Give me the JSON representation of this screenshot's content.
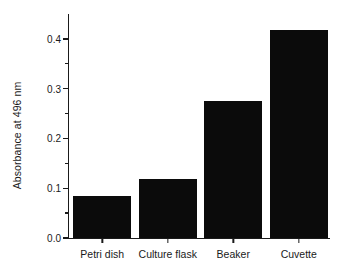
{
  "chart_data": {
    "type": "bar",
    "title": "",
    "xlabel": "",
    "ylabel": "Absorbance at 496 nm",
    "categories": [
      "Petri dish",
      "Culture flask",
      "Beaker",
      "Cuvette"
    ],
    "values": [
      0.085,
      0.118,
      0.275,
      0.418
    ],
    "ylim": [
      0.0,
      0.45
    ],
    "yticks": [
      "0.0",
      "0.1",
      "0.2",
      "0.3",
      "0.4"
    ],
    "ytick_values": [
      0.0,
      0.1,
      0.2,
      0.3,
      0.4
    ],
    "yminor_tick_values": [
      0.05,
      0.15,
      0.25,
      0.35
    ],
    "grid": false,
    "legend": null,
    "bar_color": "#0b0b0b",
    "axis_color": "#1a1a1a",
    "background": "#ffffff"
  }
}
